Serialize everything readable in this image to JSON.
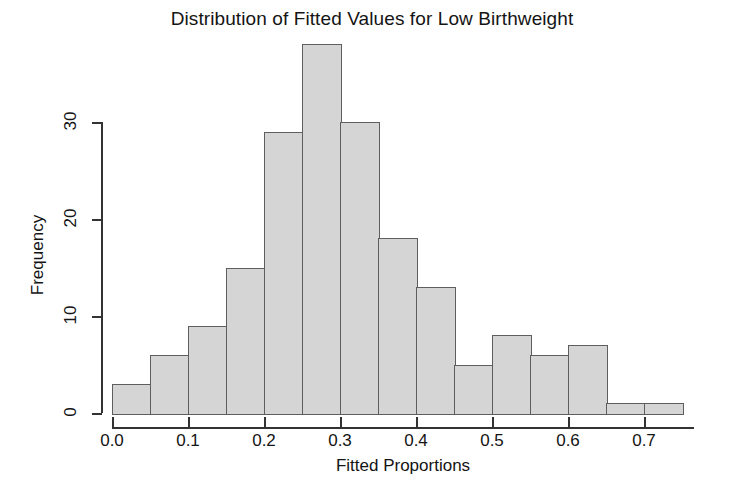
{
  "chart_data": {
    "type": "bar",
    "title": "Distribution of Fitted Values for Low Birthweight",
    "xlabel": "Fitted Proportions",
    "ylabel": "Frequency",
    "subtitle": "",
    "grid": false,
    "legend": null,
    "bin_width": 0.05,
    "xlim": [
      0.0,
      0.765
    ],
    "ylim": [
      0,
      38
    ],
    "x_ticks": [
      0.0,
      0.1,
      0.2,
      0.3,
      0.4,
      0.5,
      0.6,
      0.7
    ],
    "x_tick_labels": [
      "0.0",
      "0.1",
      "0.2",
      "0.3",
      "0.4",
      "0.5",
      "0.6",
      "0.7"
    ],
    "y_ticks": [
      0,
      10,
      20,
      30
    ],
    "y_tick_labels": [
      "0",
      "10",
      "20",
      "30"
    ],
    "bin_edges": [
      0.0,
      0.05,
      0.1,
      0.15,
      0.2,
      0.25,
      0.3,
      0.35,
      0.4,
      0.45,
      0.5,
      0.55,
      0.6,
      0.65,
      0.7,
      0.75
    ],
    "categories": [
      "0.00-0.05",
      "0.05-0.10",
      "0.10-0.15",
      "0.15-0.20",
      "0.20-0.25",
      "0.25-0.30",
      "0.30-0.35",
      "0.35-0.40",
      "0.40-0.45",
      "0.45-0.50",
      "0.50-0.55",
      "0.55-0.60",
      "0.60-0.65",
      "0.65-0.70",
      "0.70-0.75"
    ],
    "values": [
      3,
      6,
      9,
      15,
      29,
      38,
      30,
      18,
      13,
      5,
      8,
      6,
      7,
      1,
      1
    ],
    "bar_fill_color": "#d5d5d5",
    "bar_border_color": "#5e5e5e",
    "axis_color": "#333333",
    "background_color": "#ffffff"
  }
}
